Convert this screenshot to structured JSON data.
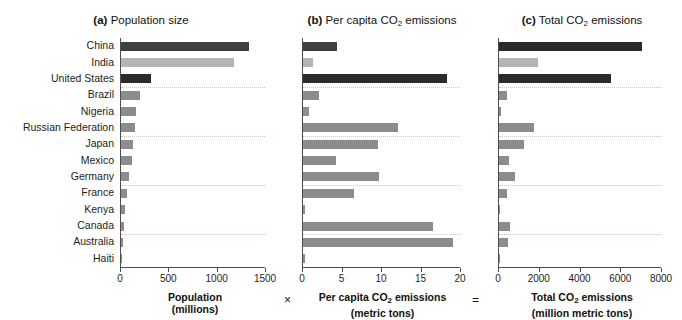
{
  "figure": {
    "operators": {
      "times": "×",
      "equals": "="
    }
  },
  "categories": [
    "China",
    "India",
    "United States",
    "Brazil",
    "Nigeria",
    "Russian Federation",
    "Japan",
    "Mexico",
    "Germany",
    "France",
    "Kenya",
    "Canada",
    "Australia",
    "Haiti"
  ],
  "colors": {
    "dark": "#3f3f3f",
    "darkest": "#2b2b2b",
    "mid": "#8c8c8c",
    "light": "#b5b5b5",
    "axis": "#4d4d4d",
    "grid": "#c9b9b9",
    "text": "#1d1d1d"
  },
  "panels": [
    {
      "tag": "(a)",
      "title": "Population size",
      "axis_title_line1": "Population",
      "axis_title_line2": "(millions)",
      "ticks": [
        0,
        500,
        1000,
        1500
      ],
      "tick_labels": [
        "0",
        "500",
        "1000",
        "1500"
      ],
      "xmax": 1500
    },
    {
      "tag": "(b)",
      "title_pre": "Per capita CO",
      "title_sub": "2",
      "title_post": " emissions",
      "axis_title_pre": "Per capita CO",
      "axis_title_sub": "2",
      "axis_title_post": " emissions",
      "axis_title_line2": "(metric tons)",
      "ticks": [
        0,
        5,
        10,
        15,
        20
      ],
      "tick_labels": [
        "0",
        "5",
        "10",
        "15",
        "20"
      ],
      "xmax": 20
    },
    {
      "tag": "(c)",
      "title_pre": "Total CO",
      "title_sub": "2",
      "title_post": " emissions",
      "axis_title_pre": "Total CO",
      "axis_title_sub": "2",
      "axis_title_post": " emissions",
      "axis_title_line2": "(million metric tons)",
      "ticks": [
        0,
        2000,
        4000,
        6000,
        8000
      ],
      "tick_labels": [
        "0",
        "2000",
        "4000",
        "6000",
        "8000"
      ],
      "xmax": 8000
    }
  ],
  "chart_data": {
    "type": "bar",
    "orientation": "horizontal",
    "grid": "horizontal dotted gridlines at every 3rd category",
    "legend": "none",
    "categories": [
      "China",
      "India",
      "United States",
      "Brazil",
      "Nigeria",
      "Russian Federation",
      "Japan",
      "Mexico",
      "Germany",
      "France",
      "Kenya",
      "Canada",
      "Australia",
      "Haiti"
    ],
    "panels": [
      {
        "id": "a",
        "label": "(a) Population size",
        "xlabel": "Population (millions)",
        "xlim": [
          0,
          1500
        ],
        "xticks": [
          0,
          500,
          1000,
          1500
        ],
        "values": [
          1320,
          1170,
          310,
          195,
          155,
          142,
          127,
          113,
          82,
          64,
          40,
          34,
          22,
          10
        ],
        "bar_shades": [
          "dark",
          "light",
          "darkest",
          "mid",
          "mid",
          "mid",
          "mid",
          "mid",
          "mid",
          "mid",
          "mid",
          "mid",
          "mid",
          "mid"
        ]
      },
      {
        "id": "b",
        "label": "(b) Per capita CO2 emissions",
        "xlabel": "Per capita CO2 emissions (metric tons)",
        "xlim": [
          0,
          20
        ],
        "xticks": [
          0,
          5,
          10,
          15,
          20
        ],
        "values": [
          4.3,
          1.3,
          18.2,
          2.0,
          0.8,
          12.0,
          9.5,
          4.2,
          9.6,
          6.4,
          0.3,
          16.5,
          19.0,
          0.25
        ],
        "bar_shades": [
          "dark",
          "light",
          "darkest",
          "mid",
          "mid",
          "mid",
          "mid",
          "mid",
          "mid",
          "mid",
          "mid",
          "mid",
          "mid",
          "mid"
        ]
      },
      {
        "id": "c",
        "label": "(c) Total CO2 emissions",
        "xlabel": "Total CO2 emissions (million metric tons)",
        "xlim": [
          0,
          8000
        ],
        "xticks": [
          0,
          2000,
          4000,
          6000,
          8000
        ],
        "values": [
          7000,
          1920,
          5500,
          390,
          95,
          1700,
          1210,
          475,
          790,
          410,
          12,
          550,
          420,
          3
        ],
        "bar_shades": [
          "darkest",
          "light",
          "darkest",
          "mid",
          "mid",
          "mid",
          "mid",
          "mid",
          "mid",
          "mid",
          "mid",
          "mid",
          "mid",
          "mid"
        ]
      }
    ],
    "relation": "panel_a times panel_b equals panel_c"
  }
}
